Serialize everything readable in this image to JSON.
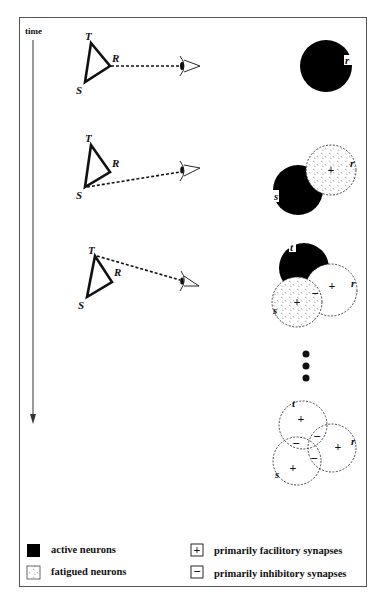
{
  "figure": {
    "axis_label": "time",
    "triangle_vertices": [
      "T",
      "R",
      "S"
    ],
    "panels": [
      {
        "step": 1,
        "viewed_vertex": "R",
        "neurons": [
          {
            "label": "r",
            "state": "active"
          }
        ],
        "synapses": []
      },
      {
        "step": 2,
        "viewed_vertex": "S",
        "neurons": [
          {
            "label": "s",
            "state": "active"
          },
          {
            "label": "r",
            "state": "fatigued"
          }
        ],
        "synapses": [
          {
            "region": "r",
            "sign": "+"
          }
        ]
      },
      {
        "step": 3,
        "viewed_vertex": "T",
        "neurons": [
          {
            "label": "t",
            "state": "active"
          },
          {
            "label": "s",
            "state": "fatigued"
          },
          {
            "label": "r",
            "state": "inactive"
          }
        ],
        "synapses": [
          {
            "region": "s",
            "sign": "+"
          },
          {
            "region": "r",
            "sign": "+"
          },
          {
            "region": "s-r overlap",
            "sign": "-"
          }
        ]
      },
      {
        "step": 4,
        "viewed_vertex": null,
        "neurons": [
          {
            "label": "t",
            "state": "inactive"
          },
          {
            "label": "s",
            "state": "inactive"
          },
          {
            "label": "r",
            "state": "inactive"
          }
        ],
        "synapses": [
          {
            "region": "t",
            "sign": "+"
          },
          {
            "region": "s",
            "sign": "+"
          },
          {
            "region": "r",
            "sign": "+"
          },
          {
            "region": "t-s overlap",
            "sign": "-"
          },
          {
            "region": "t-r overlap",
            "sign": "-"
          },
          {
            "region": "s-r overlap",
            "sign": "-"
          }
        ]
      }
    ],
    "ellipsis": "•••"
  },
  "legend": {
    "active": "active neurons",
    "fatigued": "fatigued neurons",
    "facilitory": "primarily facilitory synapses",
    "inhibitory": "primarily inhibitory synapses",
    "plus_symbol": "+",
    "minus_symbol": "−"
  },
  "colors": {
    "ink": "#111111",
    "frame": "#555555",
    "background": "#ffffff"
  }
}
